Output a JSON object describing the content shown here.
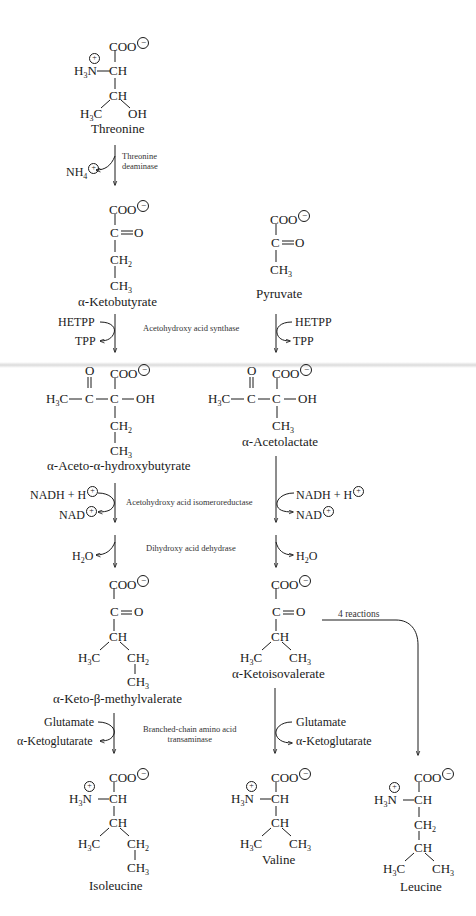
{
  "diagram": {
    "type": "biochemical pathway",
    "topic": "Biosynthesis of branched-chain amino acids (isoleucine, valine, leucine)"
  },
  "compounds": {
    "threonine": {
      "name": "Threonine",
      "formula": {
        "top": "COO",
        "amine": "H3N",
        "alpha": "CH",
        "beta": "CH",
        "left": "H3C",
        "right": "OH"
      }
    },
    "ketobutyrate": {
      "name": "α-Ketobutyrate",
      "formula": {
        "top": "COO",
        "keto": "C",
        "keto_o": "O",
        "c3": "CH2",
        "c4": "CH3"
      }
    },
    "pyruvate": {
      "name": "Pyruvate",
      "formula": {
        "top": "COO",
        "keto": "C",
        "keto_o": "O",
        "c3": "CH3"
      }
    },
    "acetohydroxybutyrate": {
      "name": "α-Aceto-α-hydroxybutyrate",
      "formula": {
        "o": "O",
        "top": "COO",
        "methyl": "H3C",
        "c1": "C",
        "c2": "C",
        "oh": "OH",
        "c3": "CH2",
        "c4": "CH3"
      }
    },
    "acetolactate": {
      "name": "α-Acetolactate",
      "formula": {
        "o": "O",
        "top": "COO",
        "methyl": "H3C",
        "c1": "C",
        "c2": "C",
        "oh": "OH",
        "c3": "CH3"
      }
    },
    "ketomethylvalerate": {
      "name": "α-Keto-β-methylvalerate",
      "formula": {
        "top": "COO",
        "keto": "C",
        "keto_o": "O",
        "ch": "CH",
        "left": "H3C",
        "right": "CH2",
        "end": "CH3"
      }
    },
    "ketoisovalerate": {
      "name": "α-Ketoisovalerate",
      "formula": {
        "top": "COO",
        "keto": "C",
        "keto_o": "O",
        "ch": "CH",
        "left": "H3C",
        "right": "CH3"
      }
    },
    "isoleucine": {
      "name": "Isoleucine",
      "formula": {
        "top": "COO",
        "amine": "H3N",
        "alpha": "CH",
        "ch": "CH",
        "left": "H3C",
        "right": "CH2",
        "end": "CH3"
      }
    },
    "valine": {
      "name": "Valine",
      "formula": {
        "top": "COO",
        "amine": "H3N",
        "alpha": "CH",
        "ch": "CH",
        "left": "H3C",
        "right": "CH3"
      }
    },
    "leucine": {
      "name": "Leucine",
      "formula": {
        "top": "COO",
        "amine": "H3N",
        "alpha": "CH",
        "c3": "CH2",
        "ch": "CH",
        "left": "H3C",
        "right": "CH3"
      }
    }
  },
  "steps": [
    {
      "enzyme": "Threonine deaminase",
      "enzyme_lines": [
        "Threonine",
        "deaminase"
      ],
      "left_out": "NH4⊕"
    },
    {
      "enzyme": "Acetohydroxy acid synthase",
      "left_in": "HETPP",
      "left_out": "TPP",
      "right_in": "HETPP",
      "right_out": "TPP"
    },
    {
      "enzyme": "Acetohydroxy acid isomeroreductase",
      "left_in": "NADH + H⊕",
      "left_out": "NAD⊕",
      "right_in": "NADH + H⊕",
      "right_out": "NAD⊕"
    },
    {
      "enzyme": "Dihydroxy acid dehydrase",
      "left_out": "H2O",
      "right_out": "H2O"
    },
    {
      "enzyme": "Branched-chain amino acid transaminase",
      "enzyme_lines": [
        "Branched-chain amino acid",
        "transaminase"
      ],
      "left_in": "Glutamate",
      "left_out": "α-Ketoglutarate",
      "right_in": "Glutamate",
      "right_out": "α-Ketoglutarate"
    },
    {
      "enzyme": "",
      "label": "4 reactions",
      "from": "α-Ketoisovalerate",
      "to": "Leucine"
    }
  ],
  "symbols": {
    "plus": "+",
    "minus": "−",
    "double_bond": "=",
    "nh4": "NH",
    "nh4_sub": "4",
    "h2o_h": "H",
    "h2o_sub": "2",
    "h2o_o": "O",
    "nadh": "NADH + H",
    "nad": "NAD"
  }
}
